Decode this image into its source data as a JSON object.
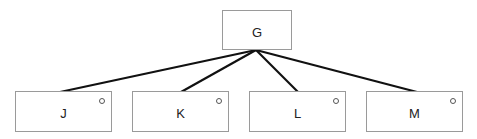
{
  "diagram": {
    "type": "tree",
    "root": {
      "id": "G",
      "label": "G"
    },
    "children": [
      {
        "id": "J",
        "label": "J",
        "has_marker": true
      },
      {
        "id": "K",
        "label": "K",
        "has_marker": true
      },
      {
        "id": "L",
        "label": "L",
        "has_marker": true
      },
      {
        "id": "M",
        "label": "M",
        "has_marker": true
      }
    ],
    "edges": [
      {
        "from": "G",
        "to": "J"
      },
      {
        "from": "G",
        "to": "K"
      },
      {
        "from": "G",
        "to": "L"
      },
      {
        "from": "G",
        "to": "M"
      }
    ]
  }
}
